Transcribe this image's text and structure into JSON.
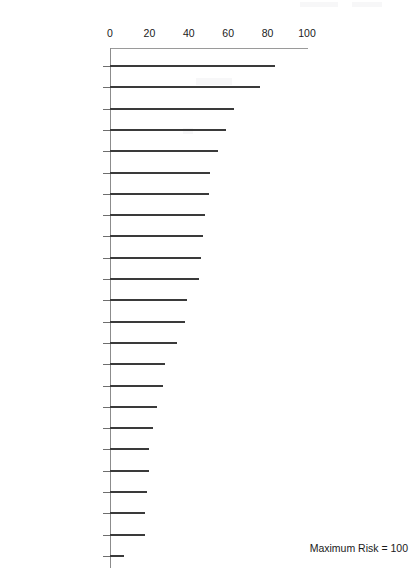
{
  "chart_data": {
    "type": "bar",
    "orientation": "horizontal",
    "title": "",
    "xlabel": "",
    "ylabel": "",
    "xlim": [
      0,
      100
    ],
    "xticks": [
      0,
      20,
      40,
      60,
      80,
      100
    ],
    "grid": false,
    "legend": null,
    "annotation": "Maximum Risk = 100",
    "categories": [
      "Iraq",
      "Myanmar",
      "Kenya",
      "Indonesia",
      "Pakistan",
      "Russia",
      "Turkey",
      "Brazil",
      "Venezuela",
      "Mexico",
      "Argentina",
      "India",
      "Thailand",
      "Egypt",
      "Hungary",
      "Czech Republic",
      "Malaysia",
      "South Korea",
      "Taiwan",
      "United Arab\nEmirates",
      "Botswana",
      "Chile",
      "Hong Kong",
      "Singapore"
    ],
    "values": [
      84,
      76,
      63,
      59,
      55,
      51,
      50,
      48,
      47,
      46,
      45,
      39,
      38,
      34,
      28,
      27,
      24,
      22,
      20,
      20,
      19,
      18,
      18,
      7
    ]
  }
}
